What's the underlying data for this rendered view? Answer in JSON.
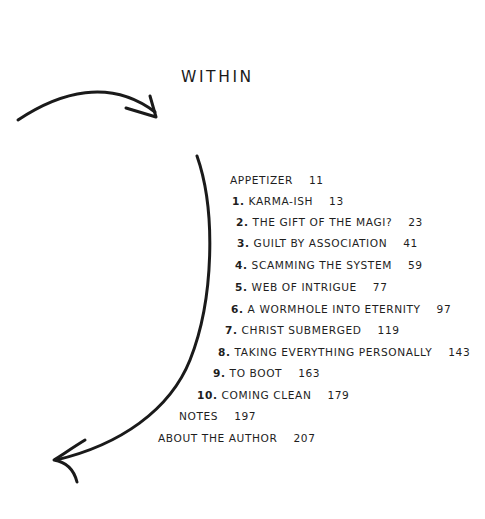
{
  "page": {
    "title": "WITHIN",
    "text_color": "#1e1e1e",
    "background": "#ffffff"
  },
  "toc": {
    "entries": [
      {
        "number": "",
        "label": "APPETIZER",
        "page": "11"
      },
      {
        "number": "1.",
        "label": "KARMA-ISH",
        "page": "13"
      },
      {
        "number": "2.",
        "label": "THE GIFT OF THE MAGI?",
        "page": "23"
      },
      {
        "number": "3.",
        "label": "GUILT BY ASSOCIATION",
        "page": "41"
      },
      {
        "number": "4.",
        "label": "SCAMMING THE SYSTEM",
        "page": "59"
      },
      {
        "number": "5.",
        "label": "WEB OF INTRIGUE",
        "page": "77"
      },
      {
        "number": "6.",
        "label": "A WORMHOLE INTO ETERNITY",
        "page": "97"
      },
      {
        "number": "7.",
        "label": "CHRIST SUBMERGED",
        "page": "119"
      },
      {
        "number": "8.",
        "label": "TAKING EVERYTHING PERSONALLY",
        "page": "143"
      },
      {
        "number": "9.",
        "label": "TO BOOT",
        "page": "163"
      },
      {
        "number": "10.",
        "label": "COMING CLEAN",
        "page": "179"
      },
      {
        "number": "",
        "label": "NOTES",
        "page": "197"
      },
      {
        "number": "",
        "label": "ABOUT THE AUTHOR",
        "page": "207"
      }
    ]
  },
  "decorations": {
    "top_arrow_icon": "curved-arrow-right-down",
    "side_arc_icon": "curved-arrow-down-left"
  }
}
